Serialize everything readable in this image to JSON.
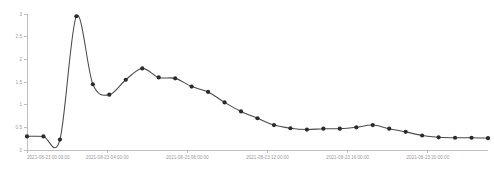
{
  "chart_data": {
    "type": "line",
    "title": "",
    "subtitle": "",
    "xlabel": "",
    "ylabel": "",
    "grid": false,
    "legend": false,
    "legend_position": "none",
    "line_color": "#4a4a4a",
    "marker_color": "#2b2b2b",
    "axis_color": "#bfbfbf",
    "tick_label_color": "#9a9a9a",
    "background_color": "#ffffff",
    "xlim": [
      "2021-08-23 00:00:00",
      "2021-08-23 23:00:00"
    ],
    "ylim": [
      0,
      3
    ],
    "y_ticks": [
      0,
      0.5,
      1,
      1.5,
      2,
      2.5,
      3
    ],
    "y_tick_labels": [
      "0",
      "0.5",
      "1",
      "1.5",
      "2",
      "2.5",
      "3"
    ],
    "x_ticks": [
      "2021-08-23 00:00:00",
      "2021-08-23 04:00:00",
      "2021-08-23 08:00:00",
      "2021-08-23 12:00:00",
      "2021-08-23 16:00:00",
      "2021-08-23 20:00:00"
    ],
    "x_tick_labels": [
      "2021-08-23 00:00:00",
      "2021-08-23 04:00:00",
      "2021-08-23 08:00:00",
      "2021-08-23 12:00:00",
      "2021-08-23 16:00:00",
      "2021-08-23 20:00:00"
    ],
    "x": [
      "2021-08-23 00:00:00",
      "2021-08-23 00:50:00",
      "2021-08-23 01:40:00",
      "2021-08-23 02:30:00",
      "2021-08-23 03:20:00",
      "2021-08-23 04:10:00",
      "2021-08-23 05:00:00",
      "2021-08-23 05:50:00",
      "2021-08-23 06:40:00",
      "2021-08-23 07:30:00",
      "2021-08-23 08:20:00",
      "2021-08-23 09:10:00",
      "2021-08-23 10:00:00",
      "2021-08-23 10:50:00",
      "2021-08-23 11:40:00",
      "2021-08-23 12:30:00",
      "2021-08-23 13:20:00",
      "2021-08-23 14:10:00",
      "2021-08-23 15:00:00",
      "2021-08-23 15:50:00",
      "2021-08-23 16:40:00",
      "2021-08-23 17:30:00",
      "2021-08-23 18:20:00",
      "2021-08-23 19:10:00",
      "2021-08-23 20:00:00",
      "2021-08-23 20:50:00",
      "2021-08-23 21:40:00",
      "2021-08-23 22:30:00",
      "2021-08-23 23:00:00"
    ],
    "values": [
      0.3,
      0.3,
      0.23,
      2.95,
      1.45,
      1.22,
      1.55,
      1.8,
      1.6,
      1.58,
      1.4,
      1.28,
      1.05,
      0.85,
      0.7,
      0.55,
      0.48,
      0.45,
      0.47,
      0.47,
      0.5,
      0.55,
      0.47,
      0.4,
      0.32,
      0.28,
      0.27,
      0.27,
      0.26
    ],
    "series": [
      {
        "name": "value",
        "values": [
          0.3,
          0.3,
          0.23,
          2.95,
          1.45,
          1.22,
          1.55,
          1.8,
          1.6,
          1.58,
          1.4,
          1.28,
          1.05,
          0.85,
          0.7,
          0.55,
          0.48,
          0.45,
          0.47,
          0.47,
          0.5,
          0.55,
          0.47,
          0.4,
          0.32,
          0.28,
          0.27,
          0.27,
          0.26
        ]
      }
    ],
    "annotations": []
  },
  "layout": {
    "width": 494,
    "height": 172,
    "plot_left": 27,
    "plot_right": 488,
    "plot_top": 14,
    "plot_bottom": 150
  }
}
